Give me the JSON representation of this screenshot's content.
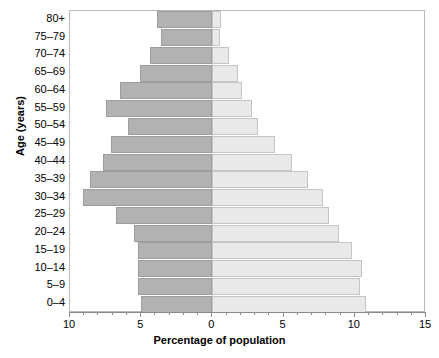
{
  "chart_data": {
    "type": "bar",
    "subtype": "population-pyramid",
    "title": "",
    "xlabel": "Percentage of population",
    "ylabel": "Age (years)",
    "categories": [
      "0–4",
      "5–9",
      "10–14",
      "15–19",
      "20–24",
      "25–29",
      "30–34",
      "35–39",
      "40–44",
      "45–49",
      "50–54",
      "55–59",
      "60–64",
      "65–69",
      "70–74",
      "75–79",
      "80+"
    ],
    "series": [
      {
        "name": "left",
        "direction": "left",
        "color": "#b2b2b2",
        "values": [
          5.0,
          5.2,
          5.2,
          5.2,
          5.5,
          6.8,
          9.1,
          8.6,
          7.7,
          7.1,
          5.9,
          7.5,
          6.5,
          5.1,
          4.4,
          3.6,
          3.9
        ]
      },
      {
        "name": "right",
        "direction": "right",
        "color": "#e9e9e9",
        "values": [
          10.8,
          10.4,
          10.5,
          9.8,
          8.9,
          8.2,
          7.8,
          6.7,
          5.6,
          4.4,
          3.2,
          2.8,
          2.1,
          1.8,
          1.2,
          0.5,
          0.6
        ]
      }
    ],
    "x_axis": {
      "min": -10,
      "max": 15,
      "zero_position": 10,
      "major_ticks": [
        -10,
        -5,
        0,
        5,
        10,
        15
      ],
      "major_tick_labels": [
        "10",
        "5",
        "0",
        "5",
        "10",
        "15"
      ],
      "minor_tick_step": 1,
      "grid": false
    },
    "y_axis": {
      "grid": false,
      "order": "bottom-to-top"
    },
    "legend": {
      "visible": false
    }
  },
  "axis_titles": {
    "x": "Percentage of population",
    "y": "Age (years)"
  }
}
